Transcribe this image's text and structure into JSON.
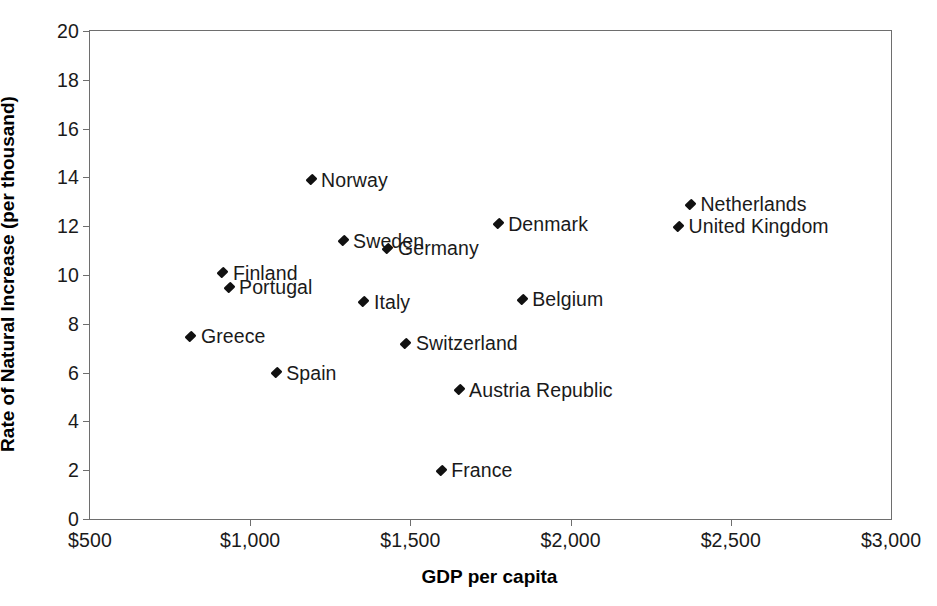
{
  "chart_data": {
    "type": "scatter",
    "title": "",
    "xlabel": "GDP per capita",
    "ylabel": "Rate of Natural Increase (per thousand)",
    "xlim": [
      500,
      3000
    ],
    "ylim": [
      0,
      20
    ],
    "xticks": [
      500,
      1000,
      1500,
      2000,
      2500,
      3000
    ],
    "xtick_labels": [
      "$500",
      "$1,000",
      "$1,500",
      "$2,000",
      "$2,500",
      "$3,000"
    ],
    "yticks": [
      0,
      2,
      4,
      6,
      8,
      10,
      12,
      14,
      16,
      18,
      20
    ],
    "ytick_labels": [
      "0",
      "2",
      "4",
      "6",
      "8",
      "10",
      "12",
      "14",
      "16",
      "18",
      "20"
    ],
    "grid": false,
    "legend": "none",
    "marker_color": "#111111",
    "frame_color": "#6e6e6e",
    "points": [
      {
        "label": "Norway",
        "x": 1190,
        "y": 13.9
      },
      {
        "label": "Netherlands",
        "x": 2374,
        "y": 12.9
      },
      {
        "label": "Denmark",
        "x": 1774,
        "y": 12.1
      },
      {
        "label": "United Kingdom",
        "x": 2337,
        "y": 12.0
      },
      {
        "label": "Sweden",
        "x": 1290,
        "y": 11.4
      },
      {
        "label": "Germany",
        "x": 1430,
        "y": 11.1
      },
      {
        "label": "Finland",
        "x": 915,
        "y": 10.1
      },
      {
        "label": "Portugal",
        "x": 934,
        "y": 9.5
      },
      {
        "label": "Belgium",
        "x": 1849,
        "y": 9.0
      },
      {
        "label": "Italy",
        "x": 1355,
        "y": 8.9
      },
      {
        "label": "Greece",
        "x": 815,
        "y": 7.5
      },
      {
        "label": "Switzerland",
        "x": 1486,
        "y": 7.2
      },
      {
        "label": "Spain",
        "x": 1081,
        "y": 6.0
      },
      {
        "label": "Austria Republic",
        "x": 1652,
        "y": 5.3
      },
      {
        "label": "France",
        "x": 1596,
        "y": 2.0
      }
    ]
  }
}
